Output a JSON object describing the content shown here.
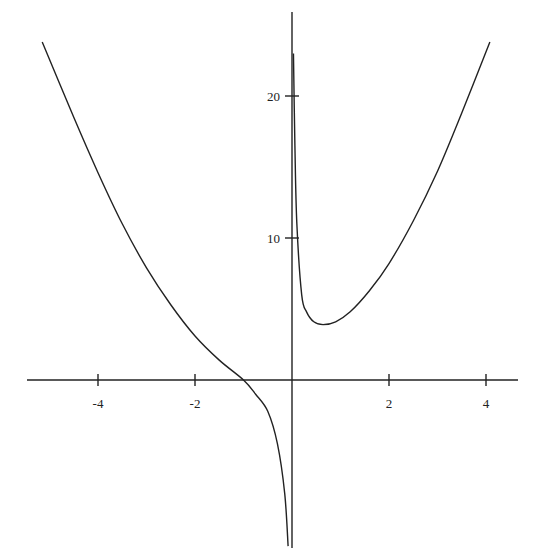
{
  "chart_data": {
    "type": "line",
    "title": "",
    "xlabel": "",
    "ylabel": "",
    "xlim": [
      -5.3,
      4.6
    ],
    "ylim": [
      -11.7,
      24.0
    ],
    "grid": false,
    "legend": null,
    "x_ticks": [
      -4,
      -2,
      2,
      4
    ],
    "x_tick_labels": [
      "-4",
      "-2",
      "2",
      "4"
    ],
    "y_ticks": [
      10,
      20
    ],
    "y_tick_labels": [
      "10",
      "20"
    ],
    "asymptote_x": 0,
    "series": [
      {
        "name": "left-branch",
        "note": "x < 0: falls from top-left, crosses y = 0 near x ≈ -1, then drops to -infinity approaching x = 0",
        "points": [
          [
            -5.15,
            23.8
          ],
          [
            -4.5,
            18.5
          ],
          [
            -4.0,
            14.6
          ],
          [
            -3.5,
            11.0
          ],
          [
            -3.0,
            7.9
          ],
          [
            -2.5,
            5.3
          ],
          [
            -2.0,
            3.1
          ],
          [
            -1.5,
            1.4
          ],
          [
            -1.0,
            0.0
          ],
          [
            -0.75,
            -1.0
          ],
          [
            -0.5,
            -2.2
          ],
          [
            -0.3,
            -4.5
          ],
          [
            -0.15,
            -8.0
          ],
          [
            -0.08,
            -11.7
          ]
        ]
      },
      {
        "name": "right-branch",
        "note": "x > 0: comes down from +infinity near x = 0, minimum ≈ (0.64, 3.9), then rises toward the top-right",
        "points": [
          [
            0.03,
            23.0
          ],
          [
            0.06,
            16.5
          ],
          [
            0.1,
            11.0
          ],
          [
            0.2,
            6.0
          ],
          [
            0.3,
            4.8
          ],
          [
            0.45,
            4.1
          ],
          [
            0.64,
            3.9
          ],
          [
            0.9,
            4.1
          ],
          [
            1.2,
            4.8
          ],
          [
            1.6,
            6.3
          ],
          [
            2.0,
            8.2
          ],
          [
            2.5,
            11.2
          ],
          [
            3.0,
            14.7
          ],
          [
            3.5,
            18.8
          ],
          [
            4.08,
            23.8
          ]
        ]
      }
    ],
    "pixel_mapping": {
      "origin_px": [
        292,
        380
      ],
      "px_per_x_unit": 48.5,
      "px_per_y_unit": 14.2
    }
  }
}
